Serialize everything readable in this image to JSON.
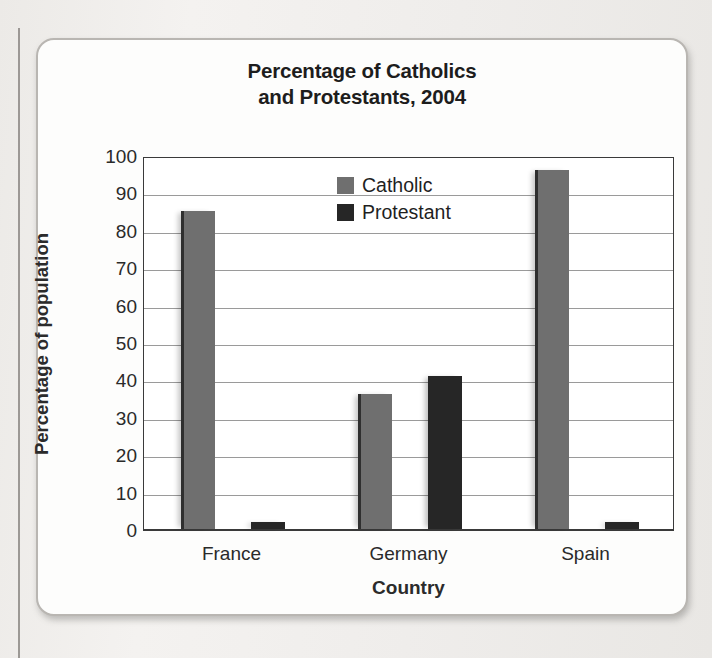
{
  "chart_data": {
    "type": "bar",
    "title": "Percentage of Catholics and Protestants, 2004",
    "title_line1": "Percentage of Catholics",
    "title_line2": "and Protestants, 2004",
    "xlabel": "Country",
    "ylabel": "Percentage of population",
    "categories": [
      "France",
      "Germany",
      "Spain"
    ],
    "series": [
      {
        "name": "Catholic",
        "color": "#6f6f6f",
        "values": [
          85,
          36,
          96
        ]
      },
      {
        "name": "Protestant",
        "color": "#262626",
        "values": [
          2,
          41,
          2
        ]
      }
    ],
    "ylim": [
      0,
      100
    ],
    "ytick_step": 10,
    "yticks": [
      100,
      90,
      80,
      70,
      60,
      50,
      40,
      30,
      20,
      10,
      0
    ],
    "grid": true,
    "grid_axis": "y",
    "legend_position": "top-center-inside"
  }
}
